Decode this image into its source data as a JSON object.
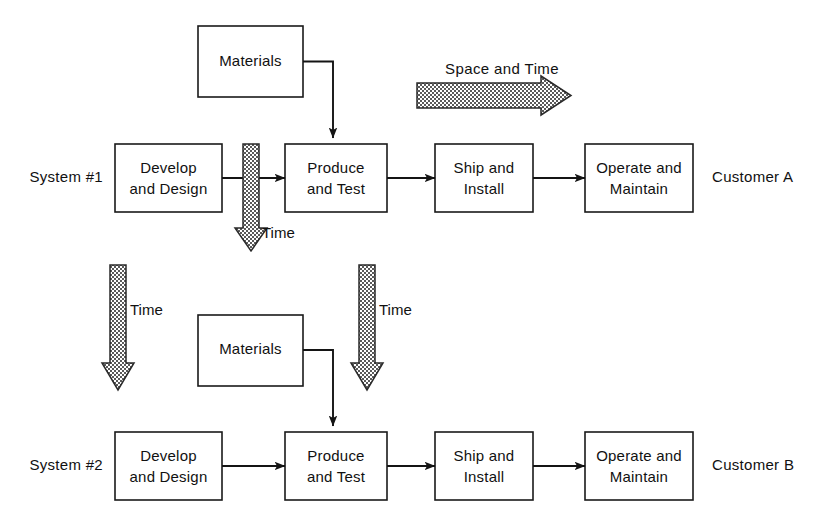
{
  "diagram": {
    "colors": {
      "line": "#141414",
      "box_stroke": "#1a1a1a",
      "box_fill": "#ffffff",
      "stipple_light": "#ffffff",
      "stipple_dark": "#4d4d4d",
      "background": "#ffffff"
    },
    "rows": [
      {
        "id": "system-1",
        "label": "System #1",
        "customer": "Customer A",
        "materials_label": "Materials",
        "stages": [
          {
            "line1": "Develop",
            "line2": "and Design"
          },
          {
            "line1": "Produce",
            "line2": "and Test"
          },
          {
            "line1": "Ship and",
            "line2": "Install"
          },
          {
            "line1": "Operate and",
            "line2": "Maintain"
          }
        ]
      },
      {
        "id": "system-2",
        "label": "System #2",
        "customer": "Customer B",
        "materials_label": "Materials",
        "stages": [
          {
            "line1": "Develop",
            "line2": "and Design"
          },
          {
            "line1": "Produce",
            "line2": "and Test"
          },
          {
            "line1": "Ship and",
            "line2": "Install"
          },
          {
            "line1": "Operate and",
            "line2": "Maintain"
          }
        ]
      }
    ],
    "axis_arrows": {
      "space_and_time": "Space and Time",
      "time_1": "Time",
      "time_2": "Time",
      "time_3": "Time"
    }
  }
}
